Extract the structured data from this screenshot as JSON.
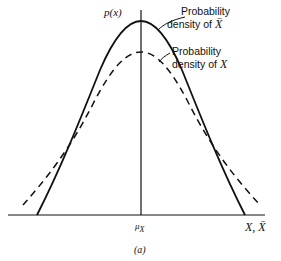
{
  "figure": {
    "y_axis_label": "p(x)",
    "x_axis_label": "X, X̄",
    "x_tick_label": "μ",
    "x_tick_subscript": "X",
    "caption": "(a)",
    "annotations": [
      {
        "line1": "Probability",
        "line2": "density of ",
        "symbol": "X̄"
      },
      {
        "line1": "Probability",
        "line2": "density of ",
        "symbol": "X"
      }
    ],
    "curves": [
      {
        "name": "density of X-bar",
        "style": "solid",
        "color": "#111111"
      },
      {
        "name": "density of X",
        "style": "dashed",
        "color": "#111111"
      }
    ]
  }
}
